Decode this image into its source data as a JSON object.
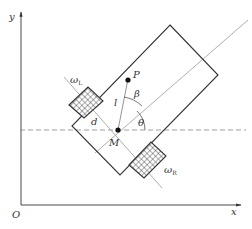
{
  "diagram": {
    "colors": {
      "stroke": "#333333",
      "axis_line": "#999999",
      "dashed": "#888888",
      "background": "#ffffff"
    },
    "axes": {
      "x_label": "x",
      "y_label": "y",
      "origin_label": "O"
    },
    "points": {
      "M": {
        "label": "M",
        "description": "midpoint of wheel axle"
      },
      "P": {
        "label": "P",
        "description": "reference point on robot"
      }
    },
    "labels": {
      "d": "d",
      "l": "l",
      "beta": "β",
      "theta": "θ",
      "omega_L": {
        "main": "ω",
        "sub": "L"
      },
      "omega_R": {
        "main": "ω",
        "sub": "R"
      }
    },
    "elements": [
      "coordinate axes",
      "robot body rectangle rotated 45°",
      "left wheel (cross-hatched)",
      "right wheel (cross-hatched)",
      "heading axis line",
      "wheel axle line",
      "horizontal dashed reference line through M",
      "segment M–P",
      "arc for angle θ",
      "arc for angle β"
    ]
  }
}
